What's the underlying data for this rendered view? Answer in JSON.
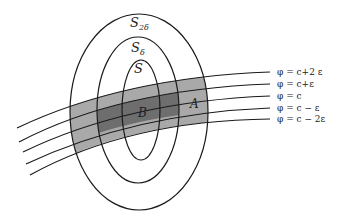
{
  "diagram": {
    "colors": {
      "background": "#ffffff",
      "stroke": "#1a1a1a",
      "band_light": "#a9a9a9",
      "band_dark": "#6e6e6e"
    },
    "surfaces": [
      {
        "label": "S",
        "subscript": "2δ",
        "cx": 139,
        "cy": 112,
        "rx": 69,
        "ry": 98,
        "label_x": 130,
        "label_y": 27
      },
      {
        "label": "S",
        "subscript": "δ",
        "cx": 138,
        "cy": 110,
        "rx": 41,
        "ry": 73,
        "label_x": 131,
        "label_y": 52
      },
      {
        "label": "S",
        "subscript": "",
        "cx": 141,
        "cy": 110,
        "rx": 19,
        "ry": 50,
        "label_x": 134,
        "label_y": 73
      }
    ],
    "level_lines": [
      {
        "label": "φ = c+2 ε",
        "y_right": 72,
        "x_left": 17,
        "y_left": 128
      },
      {
        "label": "φ = c+ε",
        "y_right": 84,
        "x_left": 19,
        "y_left": 142
      },
      {
        "label": "φ = c",
        "y_right": 96,
        "x_left": 23,
        "y_left": 152
      },
      {
        "label": "φ = c − ε",
        "y_right": 108,
        "x_left": 26,
        "y_left": 164
      },
      {
        "label": "φ = c − 2ε",
        "y_right": 119,
        "x_left": 30,
        "y_left": 175
      }
    ],
    "regions": [
      {
        "label": "A",
        "x": 190,
        "y": 108
      },
      {
        "label": "B",
        "x": 138,
        "y": 117
      }
    ]
  }
}
